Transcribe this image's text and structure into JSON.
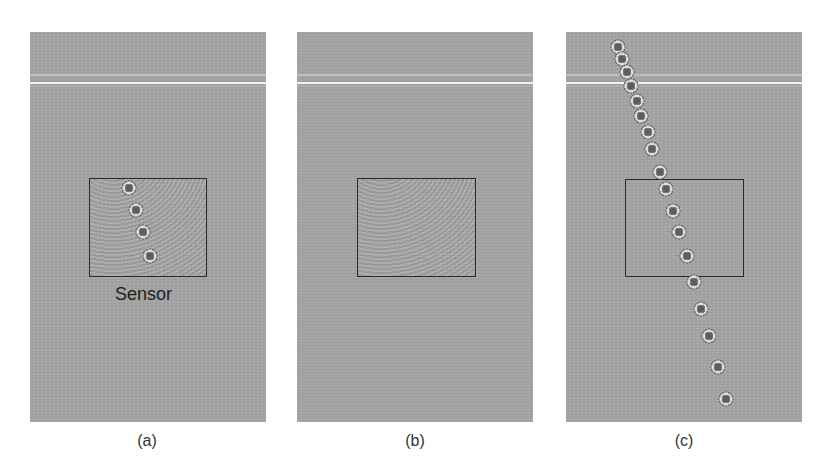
{
  "figure": {
    "panels": [
      {
        "id": "a",
        "label": "(a)",
        "sensor_label": "Sensor",
        "has_fringes": true,
        "dots": [
          [
            99,
            156
          ],
          [
            106,
            178
          ],
          [
            113,
            200
          ],
          [
            120,
            224
          ]
        ]
      },
      {
        "id": "b",
        "label": "(b)",
        "has_fringes": true,
        "dots": []
      },
      {
        "id": "c",
        "label": "(c)",
        "has_fringes": false,
        "dots": [
          [
            52,
            15
          ],
          [
            56,
            27
          ],
          [
            61,
            40
          ],
          [
            65,
            54
          ],
          [
            71,
            69
          ],
          [
            75,
            84
          ],
          [
            82,
            100
          ],
          [
            86,
            117
          ],
          [
            94,
            140
          ],
          [
            100,
            157
          ],
          [
            107,
            179
          ],
          [
            113,
            200
          ],
          [
            121,
            224
          ],
          [
            128,
            250
          ],
          [
            135,
            277
          ],
          [
            143,
            304
          ],
          [
            152,
            335
          ],
          [
            160,
            367
          ]
        ]
      }
    ],
    "colors": {
      "panel_background": "#a4a4a4",
      "sensor_outline": "#2a2a2a",
      "label_text": "#333333"
    }
  }
}
